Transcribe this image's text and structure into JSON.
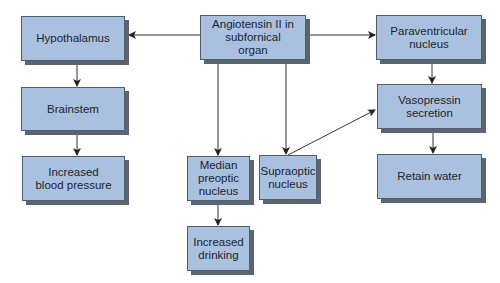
{
  "diagram": {
    "colors": {
      "box_fill": "#a9c1df",
      "box_border": "#4f5f72",
      "box_shadow": "#5c6470",
      "line": "#222222",
      "text": "#1d2330"
    },
    "nodes": {
      "hypothalamus": {
        "label": "Hypothalamus"
      },
      "brainstem": {
        "label": "Brainstem"
      },
      "increased_bp": {
        "label": "Increased blood pressure"
      },
      "angiotensin": {
        "label": "Angiotensin II in subfornical organ"
      },
      "paraventricular": {
        "label": "Paraventricular nucleus"
      },
      "vasopressin": {
        "label": "Vasopressin secretion"
      },
      "retain_water": {
        "label": "Retain water"
      },
      "median_preoptic": {
        "label": "Median preoptic nucleus"
      },
      "supraoptic": {
        "label": "Supraoptic nucleus"
      },
      "increased_drinking": {
        "label": "Increased drinking"
      }
    },
    "edges": [
      {
        "from": "angiotensin",
        "to": "hypothalamus"
      },
      {
        "from": "angiotensin",
        "to": "paraventricular"
      },
      {
        "from": "angiotensin",
        "to": "median_preoptic"
      },
      {
        "from": "angiotensin",
        "to": "supraoptic"
      },
      {
        "from": "hypothalamus",
        "to": "brainstem"
      },
      {
        "from": "brainstem",
        "to": "increased_bp"
      },
      {
        "from": "paraventricular",
        "to": "vasopressin"
      },
      {
        "from": "supraoptic",
        "to": "vasopressin"
      },
      {
        "from": "vasopressin",
        "to": "retain_water"
      },
      {
        "from": "median_preoptic",
        "to": "increased_drinking"
      }
    ]
  }
}
